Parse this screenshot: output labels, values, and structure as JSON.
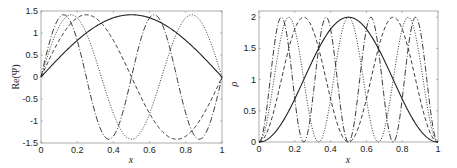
{
  "chart_data": [
    {
      "type": "line",
      "title": "",
      "xlabel": "x",
      "ylabel": "Re(Ψ)",
      "xlim": [
        0,
        1
      ],
      "ylim": [
        -1.5,
        1.5
      ],
      "xticks": [
        "0",
        "0.2",
        "0.4",
        "0.6",
        "0.8",
        "1"
      ],
      "yticks": [
        "-1.5",
        "-1",
        "-0.5",
        "0",
        "0.5",
        "1",
        "1.5"
      ],
      "grid": false,
      "legend": null,
      "series": [
        {
          "name": "n=1",
          "style": "solid",
          "formula": "sqrt(2)*sin(1*pi*x)",
          "peak": 1.414
        },
        {
          "name": "n=2",
          "style": "dashed",
          "formula": "sqrt(2)*sin(2*pi*x)",
          "peak": 1.414
        },
        {
          "name": "n=3",
          "style": "dotted",
          "formula": "sqrt(2)*sin(3*pi*x)",
          "peak": 1.414
        },
        {
          "name": "n=4",
          "style": "dash-dot",
          "formula": "sqrt(2)*sin(4*pi*x)",
          "peak": 1.414
        }
      ]
    },
    {
      "type": "line",
      "title": "",
      "xlabel": "x",
      "ylabel": "ρ",
      "xlim": [
        0,
        1
      ],
      "ylim": [
        0,
        2.1
      ],
      "xticks": [
        "0",
        "0.2",
        "0.4",
        "0.6",
        "0.8",
        "1"
      ],
      "yticks": [
        "0",
        "0.5",
        "1",
        "1.5",
        "2"
      ],
      "grid": false,
      "legend": null,
      "series": [
        {
          "name": "n=1",
          "style": "solid",
          "formula": "2*sin^2(1*pi*x)",
          "peak": 2
        },
        {
          "name": "n=2",
          "style": "dashed",
          "formula": "2*sin^2(2*pi*x)",
          "peak": 2
        },
        {
          "name": "n=3",
          "style": "dotted",
          "formula": "2*sin^2(3*pi*x)",
          "peak": 2
        },
        {
          "name": "n=4",
          "style": "dash-dot",
          "formula": "2*sin^2(4*pi*x)",
          "peak": 2
        }
      ]
    }
  ]
}
